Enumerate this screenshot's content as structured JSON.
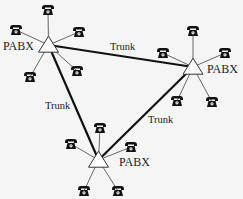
{
  "diagram": {
    "title": "",
    "nodes": [
      {
        "id": "pabx_left",
        "label": "PABX",
        "x": 48.5,
        "y": 45,
        "label_x": 3,
        "label_y": 50,
        "label_anchor": "start"
      },
      {
        "id": "pabx_right",
        "label": "PABX",
        "x": 193,
        "y": 67,
        "label_x": 207,
        "label_y": 73,
        "label_anchor": "start"
      },
      {
        "id": "pabx_bottom",
        "label": "PABX",
        "x": 98.5,
        "y": 160,
        "label_x": 119,
        "label_y": 166,
        "label_anchor": "start"
      }
    ],
    "trunks": [
      {
        "from": "pabx_left",
        "to": "pabx_right",
        "label": "Trunk",
        "label_x": 110,
        "label_y": 50
      },
      {
        "from": "pabx_left",
        "to": "pabx_bottom",
        "label": "Trunk",
        "label_x": 45,
        "label_y": 109
      },
      {
        "from": "pabx_right",
        "to": "pabx_bottom",
        "label": "Trunk",
        "label_x": 148,
        "label_y": 123
      }
    ],
    "phones": [
      {
        "pabx": "pabx_left",
        "x": 48,
        "y": 10
      },
      {
        "pabx": "pabx_left",
        "x": 16,
        "y": 30
      },
      {
        "pabx": "pabx_left",
        "x": 79,
        "y": 32
      },
      {
        "pabx": "pabx_left",
        "x": 30,
        "y": 77
      },
      {
        "pabx": "pabx_left",
        "x": 77,
        "y": 71
      },
      {
        "pabx": "pabx_right",
        "x": 193,
        "y": 31
      },
      {
        "pabx": "pabx_right",
        "x": 163,
        "y": 53
      },
      {
        "pabx": "pabx_right",
        "x": 225,
        "y": 53
      },
      {
        "pabx": "pabx_right",
        "x": 177,
        "y": 101
      },
      {
        "pabx": "pabx_right",
        "x": 212,
        "y": 102
      },
      {
        "pabx": "pabx_bottom",
        "x": 100,
        "y": 128
      },
      {
        "pabx": "pabx_bottom",
        "x": 71,
        "y": 144
      },
      {
        "pabx": "pabx_bottom",
        "x": 131,
        "y": 147
      },
      {
        "pabx": "pabx_bottom",
        "x": 84,
        "y": 191
      },
      {
        "pabx": "pabx_bottom",
        "x": 118,
        "y": 191
      }
    ],
    "icons": {
      "node": "triangle-pabx-icon",
      "endpoint": "telephone-icon"
    },
    "colors": {
      "trunk": "#111111",
      "branch": "#666666",
      "phone": "#111111",
      "node_fill": "#ffffff",
      "node_stroke": "#333333"
    }
  }
}
